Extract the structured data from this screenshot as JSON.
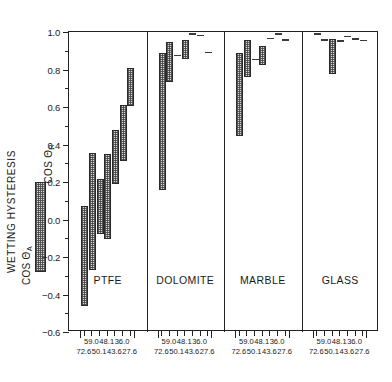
{
  "chart_data": {
    "type": "bar",
    "title": "",
    "ylabel": "WETTING HYSTERESIS  COS Θ_A – COS Θ_R",
    "xlabel": "",
    "ylim": [
      -0.6,
      1.0
    ],
    "yticks": [
      1.0,
      0.8,
      0.6,
      0.4,
      0.2,
      0.0,
      -0.2,
      -0.4,
      -0.6
    ],
    "ytick_labels": [
      "1.0",
      "0.8",
      "0.6",
      "0.4",
      "0.2",
      "0.0",
      "−0.2",
      "−0.4",
      "−0.6"
    ],
    "yminor_ticks": [
      0.9,
      0.7,
      0.5,
      0.3,
      0.1,
      -0.1,
      -0.3,
      -0.5
    ],
    "grid": false,
    "legend_position": "left-outside",
    "x_tick_labels_row1": [
      "59.0",
      "48.1",
      "36.0"
    ],
    "x_tick_labels_row2": [
      "72.6",
      "50.1",
      "43.6",
      "27.6"
    ],
    "groups": [
      {
        "name": "PTFE",
        "bars": [
          {
            "x_label": "72.6",
            "cos_theta_A": -0.46,
            "cos_theta_R": 0.07
          },
          {
            "x_label": "59.0",
            "cos_theta_A": -0.27,
            "cos_theta_R": 0.355
          },
          {
            "x_label": "50.1",
            "cos_theta_A": -0.075,
            "cos_theta_R": 0.215
          },
          {
            "x_label": "48.1",
            "cos_theta_A": -0.105,
            "cos_theta_R": 0.35
          },
          {
            "x_label": "43.6",
            "cos_theta_A": 0.19,
            "cos_theta_R": 0.475
          },
          {
            "x_label": "36.0",
            "cos_theta_A": 0.31,
            "cos_theta_R": 0.61
          },
          {
            "x_label": "27.6",
            "cos_theta_A": 0.605,
            "cos_theta_R": 0.81
          }
        ]
      },
      {
        "name": "DOLOMITE",
        "bars": [
          {
            "x_label": "72.6",
            "cos_theta_A": 0.155,
            "cos_theta_R": 0.89
          },
          {
            "x_label": "59.0",
            "cos_theta_A": 0.735,
            "cos_theta_R": 0.945
          },
          {
            "x_label": "50.1",
            "cos_theta_A": 0.87,
            "cos_theta_R": 0.878
          },
          {
            "x_label": "48.1",
            "cos_theta_A": 0.855,
            "cos_theta_R": 0.955
          },
          {
            "x_label": "43.6",
            "cos_theta_A": 0.985,
            "cos_theta_R": 0.995
          },
          {
            "x_label": "36.0",
            "cos_theta_A": 0.975,
            "cos_theta_R": 0.985
          },
          {
            "x_label": "27.6",
            "cos_theta_A": 0.888,
            "cos_theta_R": 0.896
          }
        ]
      },
      {
        "name": "MARBLE",
        "bars": [
          {
            "x_label": "72.6",
            "cos_theta_A": 0.445,
            "cos_theta_R": 0.89
          },
          {
            "x_label": "59.0",
            "cos_theta_A": 0.76,
            "cos_theta_R": 0.96
          },
          {
            "x_label": "50.1",
            "cos_theta_A": 0.85,
            "cos_theta_R": 0.858
          },
          {
            "x_label": "48.1",
            "cos_theta_A": 0.825,
            "cos_theta_R": 0.925
          },
          {
            "x_label": "43.6",
            "cos_theta_A": 0.962,
            "cos_theta_R": 0.97
          },
          {
            "x_label": "36.0",
            "cos_theta_A": 0.985,
            "cos_theta_R": 0.993
          },
          {
            "x_label": "27.6",
            "cos_theta_A": 0.953,
            "cos_theta_R": 0.961
          }
        ]
      },
      {
        "name": "GLASS",
        "bars": [
          {
            "x_label": "72.6",
            "cos_theta_A": 0.985,
            "cos_theta_R": 0.993
          },
          {
            "x_label": "59.0",
            "cos_theta_A": 0.955,
            "cos_theta_R": 0.963
          },
          {
            "x_label": "50.1",
            "cos_theta_A": 0.775,
            "cos_theta_R": 0.965
          },
          {
            "x_label": "48.1",
            "cos_theta_A": 0.948,
            "cos_theta_R": 0.956
          },
          {
            "x_label": "43.6",
            "cos_theta_A": 0.972,
            "cos_theta_R": 0.98
          },
          {
            "x_label": "36.0",
            "cos_theta_A": 0.958,
            "cos_theta_R": 0.966
          },
          {
            "x_label": "27.6",
            "cos_theta_A": 0.952,
            "cos_theta_R": 0.96
          }
        ]
      }
    ]
  },
  "axis": {
    "y_title_main": "WETTING HYSTERESIS",
    "legend_top": "COS Θ",
    "legend_top_sub": "R",
    "legend_bottom": "COS Θ",
    "legend_bottom_sub": "A"
  },
  "colors": {
    "frame": "#222222",
    "bar_fill": "#d8d8d8",
    "bar_edge": "#2a2a2a",
    "text": "#1a1a1a",
    "background": "#ffffff"
  }
}
